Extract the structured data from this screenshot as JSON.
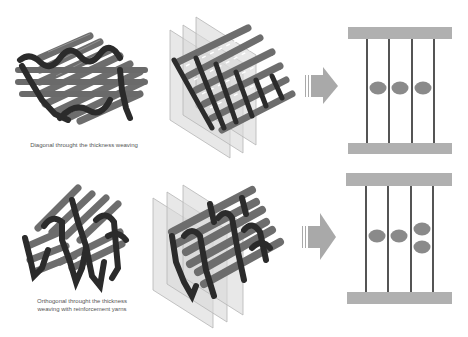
{
  "colors": {
    "rod": "#6d6d6d",
    "rod_highlight": "#9a9a9a",
    "yarn": "#2b2b2b",
    "plane": "#d9d9d9",
    "plane_edge": "#b5b5b5",
    "arrow": "#a9a9a9",
    "bar": "#b0b0b0",
    "line": "#2a2a2a",
    "ellipse": "#8a8a8a",
    "caption": "#555555"
  },
  "rows": [
    {
      "id": "diagonal",
      "caption_lines": [
        "Diagonal throught the thickness weaving"
      ],
      "weave_3d": "diagonal-weave-illustration",
      "section_view": "sectioned-weave-illustration",
      "schematic": {
        "vertical_lines": 4,
        "ellipses": [
          {
            "col": 1,
            "y": 88
          },
          {
            "col": 2,
            "y": 88
          },
          {
            "col": 3,
            "y": 88
          }
        ]
      }
    },
    {
      "id": "orthogonal",
      "caption_lines": [
        "Orthogonal throught the thickness",
        "weaving with reinforcement yarns"
      ],
      "weave_3d": "orthogonal-weave-illustration",
      "section_view": "sectioned-weave-illustration",
      "schematic": {
        "vertical_lines": 4,
        "ellipses": [
          {
            "col": 1,
            "y": 236
          },
          {
            "col": 2,
            "y": 236
          },
          {
            "col": 3,
            "y": 229
          },
          {
            "col": 3,
            "y": 247
          }
        ]
      }
    }
  ]
}
